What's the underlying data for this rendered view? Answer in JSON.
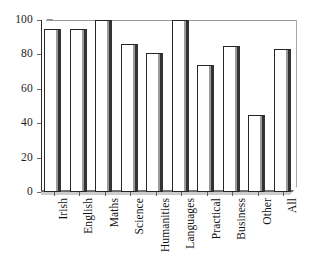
{
  "chart_data": {
    "type": "bar",
    "title": "",
    "subtitle": "",
    "xlabel": "",
    "ylabel": "",
    "categories": [
      "Irish",
      "English",
      "Maths",
      "Science",
      "Humanities",
      "Languages",
      "Practical",
      "Business",
      "Other",
      "All"
    ],
    "values": [
      95,
      95,
      100,
      86,
      81,
      100,
      74,
      85,
      45,
      83
    ],
    "series": [
      {
        "name": "Percentage",
        "values": [
          95,
          95,
          100,
          86,
          81,
          100,
          74,
          85,
          45,
          83
        ]
      }
    ],
    "ylim": [
      0,
      100
    ],
    "y_ticks": [
      0,
      20,
      40,
      60,
      80,
      100
    ],
    "y_tick_labels": [
      "0",
      "20",
      "40",
      "60",
      "80",
      "100"
    ],
    "grid": false,
    "legend": false,
    "legend_position": "none",
    "bar_style": {
      "fill": "#ffffff",
      "edge": "#262626",
      "shadow": "#4a4a4a"
    },
    "axis_color": "#2e2e2e",
    "background": "#ffffff",
    "x_label_rotation": -90,
    "annotations": []
  }
}
